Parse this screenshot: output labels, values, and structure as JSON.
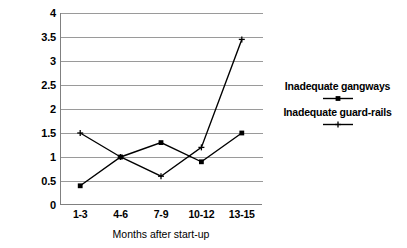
{
  "chart_data": {
    "type": "line",
    "title": "",
    "xlabel": "Months after start-up",
    "ylabel": "",
    "categories": [
      "1-3",
      "4-6",
      "7-9",
      "10-12",
      "13-15"
    ],
    "yticks": [
      "0",
      "0.5",
      "1",
      "1.5",
      "2",
      "2.5",
      "3",
      "3.5",
      "4"
    ],
    "ytick_values": [
      0,
      0.5,
      1,
      1.5,
      2,
      2.5,
      3,
      3.5,
      4
    ],
    "ylim": [
      0,
      4
    ],
    "grid": "horizontal",
    "legend_position": "right",
    "series": [
      {
        "name": "Inadequate gangways",
        "marker": "square",
        "color": "#000000",
        "values": [
          0.4,
          1.0,
          1.3,
          0.9,
          1.5
        ]
      },
      {
        "name": "Inadequate guard-rails",
        "marker": "plus",
        "color": "#000000",
        "values": [
          1.5,
          1.0,
          0.6,
          1.2,
          3.45
        ]
      }
    ]
  },
  "legend": {
    "entries": [
      {
        "label": "Inadequate gangways",
        "marker_icon": "square-marker-icon"
      },
      {
        "label": "Inadequate guard-rails",
        "marker_icon": "plus-marker-icon"
      }
    ]
  },
  "axes": {
    "x_title": "Months after start-up"
  },
  "colors": {
    "line": "#000000",
    "grid": "#9a9a9a",
    "axis": "#808080",
    "background": "#ffffff"
  }
}
